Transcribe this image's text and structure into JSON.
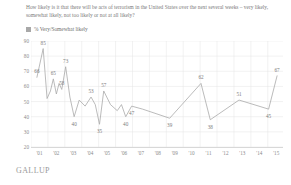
{
  "title": "How likely is it that there will be acts of terrorism in the United States over the next several weeks – very likely, somewhat likely, not too likely or not at all likely?",
  "legend_label": "% Very/Somewhat likely",
  "source": "GALLUP",
  "colors": {
    "line": "#a9a9a9",
    "legend_swatch": "#a8a8a8",
    "grid": "#e4e4e4",
    "text": "#7a7a7a"
  },
  "chart_data": {
    "type": "line",
    "title": "How likely is it that there will be acts of terrorism in the United States over the next several weeks – very likely, somewhat likely, not too likely or not at all likely?",
    "xlabel": "",
    "ylabel": "",
    "ylim": [
      20,
      90
    ],
    "yticks": [
      20,
      30,
      40,
      50,
      60,
      70,
      80,
      90
    ],
    "xticks": [
      "'01",
      "'02",
      "'03",
      "'04",
      "'05",
      "'06",
      "'07",
      "'08",
      "'09",
      "'10",
      "'11",
      "'12",
      "'13",
      "'14",
      "'15"
    ],
    "grid": true,
    "legend_position": "top-left",
    "series": [
      {
        "name": "% Very/Somewhat likely",
        "points": [
          {
            "x": 2001.35,
            "y": 66,
            "label": "66"
          },
          {
            "x": 2001.72,
            "y": 85,
            "label": "85"
          },
          {
            "x": 2001.95,
            "y": 52,
            "label": ""
          },
          {
            "x": 2002.15,
            "y": 57,
            "label": ""
          },
          {
            "x": 2002.32,
            "y": 65,
            "label": "65"
          },
          {
            "x": 2002.5,
            "y": 55,
            "label": ""
          },
          {
            "x": 2002.66,
            "y": 62,
            "label": ""
          },
          {
            "x": 2002.82,
            "y": 58,
            "label": "58"
          },
          {
            "x": 2003.05,
            "y": 73,
            "label": "73"
          },
          {
            "x": 2003.3,
            "y": 53,
            "label": ""
          },
          {
            "x": 2003.55,
            "y": 40,
            "label": "40"
          },
          {
            "x": 2003.85,
            "y": 51,
            "label": ""
          },
          {
            "x": 2004.2,
            "y": 47,
            "label": ""
          },
          {
            "x": 2004.55,
            "y": 53,
            "label": "53"
          },
          {
            "x": 2004.8,
            "y": 48,
            "label": ""
          },
          {
            "x": 2005.05,
            "y": 35,
            "label": "35"
          },
          {
            "x": 2005.3,
            "y": 57,
            "label": "57"
          },
          {
            "x": 2005.7,
            "y": 48,
            "label": ""
          },
          {
            "x": 2006.1,
            "y": 44,
            "label": ""
          },
          {
            "x": 2006.35,
            "y": 48,
            "label": ""
          },
          {
            "x": 2006.6,
            "y": 40,
            "label": "40"
          },
          {
            "x": 2006.95,
            "y": 47,
            "label": "47"
          },
          {
            "x": 2007.6,
            "y": 45,
            "label": ""
          },
          {
            "x": 2009.2,
            "y": 39,
            "label": "39"
          },
          {
            "x": 2011.05,
            "y": 62,
            "label": "62"
          },
          {
            "x": 2011.6,
            "y": 38,
            "label": "38"
          },
          {
            "x": 2013.3,
            "y": 51,
            "label": "51"
          },
          {
            "x": 2015.05,
            "y": 45,
            "label": "45"
          },
          {
            "x": 2015.55,
            "y": 67,
            "label": "67"
          }
        ]
      }
    ]
  }
}
